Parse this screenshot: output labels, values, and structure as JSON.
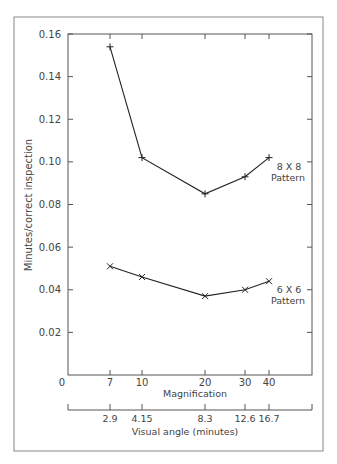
{
  "chart_data": {
    "type": "line",
    "title": "",
    "ylabel": "Minutes/correct inspection",
    "xlabel": "Magnification",
    "secondary_xlabel": "Visual angle (minutes)",
    "ylim": [
      0,
      0.16
    ],
    "yticks": [
      "0.16",
      "0.14",
      "0.12",
      "0.10",
      "0.08",
      "0.06",
      "0.04",
      "0.02"
    ],
    "ytick_values": [
      0.16,
      0.14,
      0.12,
      0.1,
      0.08,
      0.06,
      0.04,
      0.02
    ],
    "x_origin_label": "0",
    "categories": [
      "7",
      "10",
      "20",
      "30",
      "40"
    ],
    "secondary_categories": [
      "2.9",
      "4.15",
      "8.3",
      "12.6",
      "16.7"
    ],
    "grid": false,
    "series": [
      {
        "name": "8 X 8 Pattern",
        "label_line1": "8 X 8",
        "label_line2": "Pattern",
        "marker": "+",
        "values": [
          0.154,
          0.102,
          0.085,
          0.093,
          0.102
        ]
      },
      {
        "name": "6 X 6 Pattern",
        "label_line1": "6 X 6",
        "label_line2": "Pattern",
        "marker": "x",
        "values": [
          0.051,
          0.046,
          0.037,
          0.04,
          0.044
        ]
      }
    ]
  }
}
